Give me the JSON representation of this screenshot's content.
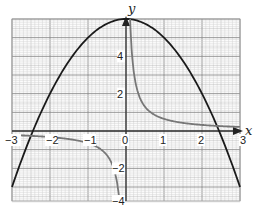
{
  "chart_data": {
    "type": "line",
    "title": "",
    "xlabel": "x",
    "ylabel": "y",
    "xlim": [
      -3,
      3
    ],
    "ylim": [
      -3.8,
      6
    ],
    "grid": true,
    "x_ticks": [
      -3,
      -2,
      -1,
      0,
      1,
      2,
      3
    ],
    "x_tick_labels": [
      "−3",
      "−2",
      "−1",
      "0",
      "1",
      "2",
      "3"
    ],
    "y_ticks": [
      6,
      4,
      2,
      -2,
      -4
    ],
    "y_tick_labels": [
      "6",
      "4",
      "2",
      "−2",
      "−4"
    ],
    "series": [
      {
        "name": "parabola",
        "color": "#1a1a1a",
        "description": "y = 6 − x²",
        "x": [
          -3,
          -2.5,
          -2,
          -1.5,
          -1,
          -0.5,
          0,
          0.5,
          1,
          1.5,
          2,
          2.5,
          3
        ],
        "y": [
          -3,
          -0.25,
          2,
          3.75,
          5,
          5.75,
          6,
          5.75,
          5,
          3.75,
          2,
          -0.25,
          -3
        ]
      },
      {
        "name": "hyperbola-positive-branch",
        "color": "#777777",
        "description": "y ≈ 0.65/x, x > 0",
        "x": [
          0.11,
          0.2,
          0.3,
          0.5,
          1,
          1.5,
          2,
          2.5,
          3
        ],
        "y": [
          6,
          3.25,
          2.17,
          1.3,
          0.65,
          0.43,
          0.33,
          0.26,
          0.22
        ]
      },
      {
        "name": "hyperbola-negative-branch",
        "color": "#777777",
        "description": "y ≈ 0.65/x, x < 0",
        "x": [
          -3,
          -2.5,
          -2,
          -1.5,
          -1,
          -0.5,
          -0.3,
          -0.2,
          -0.17
        ],
        "y": [
          -0.22,
          -0.26,
          -0.33,
          -0.43,
          -0.65,
          -1.3,
          -2.17,
          -3.25,
          -3.8
        ]
      }
    ],
    "annotations": [
      "y-axis arrow",
      "x-axis arrow"
    ]
  }
}
